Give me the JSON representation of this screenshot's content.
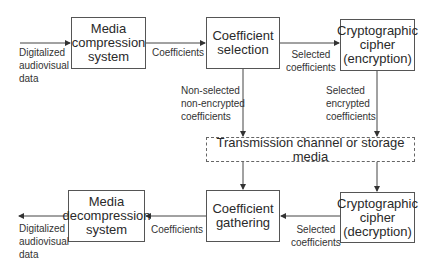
{
  "boxes": {
    "media_compression": "Media\ncompression\nsystem",
    "coefficient_selection": "Coefficient\nselection",
    "crypto_encryption": "Cryptographic\ncipher\n(encryption)",
    "transmission": "Transmission channel or storage media",
    "media_decompression": "Media\ndecompression\nsystem",
    "coefficient_gathering": "Coefficient\ngathering",
    "crypto_decryption": "Cryptographic\ncipher\n(decryption)"
  },
  "edges": {
    "input_data": "Digitalized\naudiovisual\ndata",
    "compression_to_selection": "Coefficients",
    "selection_to_encryption": "Selected\ncoefficients",
    "non_selected": "Non-selected\nnon-encrypted\ncoefficients",
    "encrypted": "Selected\nencrypted\ncoefficients",
    "decryption_to_gathering": "Selected\ncoefficients",
    "gathering_to_decompression": "Coefficients",
    "output_data": "Digitalized\naudiovisual\ndata"
  }
}
